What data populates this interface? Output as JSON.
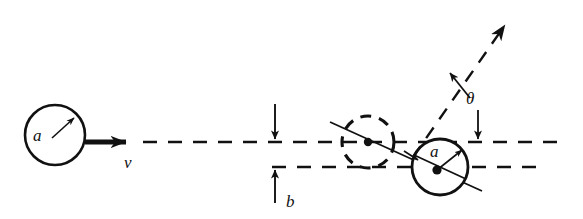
{
  "figure": {
    "kind": "physics-scattering-diagram",
    "background_color": "#ffffff",
    "stroke_color": "#111111"
  },
  "labels": {
    "radius_incident": "a",
    "velocity": "v",
    "impact_parameter": "b",
    "scattering_angle": "θ",
    "radius_target": "a"
  },
  "elements": {
    "incident_sphere": {
      "name": "incident-sphere",
      "cx": 55,
      "cy": 135,
      "r": 30,
      "style": "solid",
      "radius_label": "a"
    },
    "target_sphere_ghost": {
      "name": "target-sphere-initial-position",
      "cx": 368,
      "cy": 142,
      "r": 26,
      "style": "dashed"
    },
    "target_sphere": {
      "name": "target-sphere-contact-position",
      "cx": 440,
      "cy": 167,
      "r": 28,
      "style": "solid",
      "radius_label": "a"
    },
    "velocity_arrow": {
      "name": "velocity-arrow",
      "x1": 85,
      "y1": 142,
      "x2": 138,
      "y2": 142,
      "label": "v"
    },
    "incident_trajectory": {
      "name": "incident-trajectory-dashed-line",
      "x1": 142,
      "y1": 142,
      "x2": 560,
      "y2": 142
    },
    "target_axis_line": {
      "name": "target-axis-dashed-line",
      "x1": 272,
      "y1": 167,
      "x2": 545,
      "y2": 167
    },
    "scattered_trajectory": {
      "name": "scattered-trajectory-arrow",
      "x1": 415,
      "y1": 158,
      "x2": 512,
      "y2": 19
    },
    "impact_parameter_marks": {
      "name": "impact-parameter-dimension",
      "x": 275,
      "top_y": 104,
      "line1_y": 142,
      "line2_y": 167,
      "bottom_y": 203,
      "label": "b",
      "label_x": 290,
      "label_y": 203
    },
    "angle_marks": {
      "name": "scattering-angle-dimension",
      "upper_arrow": {
        "x1": 468,
        "y1": 96,
        "x2": 448,
        "y2": 71
      },
      "lower_arrow": {
        "x1": 478,
        "y1": 112,
        "x2": 478,
        "y2": 141
      },
      "label": "θ",
      "label_x": 473,
      "label_y": 103
    },
    "line_of_centers": {
      "name": "line-of-centers",
      "x1": 330,
      "y1": 122,
      "x2": 482,
      "y2": 191
    }
  }
}
